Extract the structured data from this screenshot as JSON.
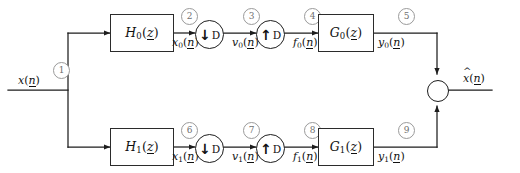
{
  "diagram": {
    "type": "block-diagram",
    "colors": {
      "line": "#1d1d1d",
      "box_border": "#2b2b2b",
      "node_border": "#9a9a9a",
      "node_text": "#6f6f6f",
      "background": "#ffffff"
    }
  },
  "input": {
    "signal": "x",
    "signal_sub": "",
    "arg_open": "(",
    "arg": "n",
    "arg_close": ")"
  },
  "output": {
    "signal": "x",
    "hat": "^",
    "arg_open": "(",
    "arg": "n",
    "arg_close": ")"
  },
  "branches": [
    {
      "id": "upper",
      "analysis_filter": {
        "name": "H",
        "sub": "0",
        "arg": "z"
      },
      "synthesis_filter": {
        "name": "G",
        "sub": "0",
        "arg": "z"
      },
      "decimator": {
        "arrow": "down",
        "factor": "D"
      },
      "expander": {
        "arrow": "up",
        "factor": "D"
      },
      "signals": [
        {
          "node": "2",
          "name": "x",
          "sub": "0",
          "arg": "n"
        },
        {
          "node": "3",
          "name": "v",
          "sub": "0",
          "arg": "n"
        },
        {
          "node": "4",
          "name": "f",
          "sub": "0",
          "arg": "n"
        },
        {
          "node": "5",
          "name": "y",
          "sub": "0",
          "arg": "n"
        }
      ]
    },
    {
      "id": "lower",
      "analysis_filter": {
        "name": "H",
        "sub": "1",
        "arg": "z"
      },
      "synthesis_filter": {
        "name": "G",
        "sub": "1",
        "arg": "z"
      },
      "decimator": {
        "arrow": "down",
        "factor": "D"
      },
      "expander": {
        "arrow": "up",
        "factor": "D"
      },
      "signals": [
        {
          "node": "6",
          "name": "x",
          "sub": "1",
          "arg": "n"
        },
        {
          "node": "7",
          "name": "v",
          "sub": "1",
          "arg": "n"
        },
        {
          "node": "8",
          "name": "f",
          "sub": "1",
          "arg": "n"
        },
        {
          "node": "9",
          "name": "y",
          "sub": "1",
          "arg": "n"
        }
      ]
    }
  ],
  "split_node": "1",
  "arrows": {
    "down_glyph": "↓",
    "up_glyph": "↑"
  }
}
